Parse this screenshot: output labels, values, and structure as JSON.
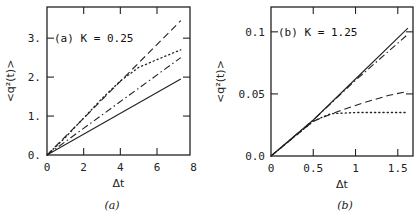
{
  "chart_data": [
    {
      "type": "line",
      "panel": "a",
      "annotation": "(a)  K = 0.25",
      "caption": "(a)",
      "xlabel": "Δt",
      "ylabel": "<q²(t)>",
      "xlim": [
        0,
        7.8
      ],
      "ylim": [
        0,
        3.8
      ],
      "xticks": [
        0,
        2,
        4,
        6,
        8
      ],
      "xtick_labels": [
        "0",
        "2",
        "4",
        "6",
        "8"
      ],
      "yticks": [
        0,
        1,
        2,
        3
      ],
      "ytick_labels": [
        "0.",
        "1.",
        "2.",
        "3."
      ],
      "grid": false,
      "series": [
        {
          "name": "solid",
          "style": "solid",
          "x": [
            0,
            7.3
          ],
          "y": [
            0,
            1.95
          ]
        },
        {
          "name": "dash-dot",
          "style": "dashdot",
          "x": [
            0,
            7.3
          ],
          "y": [
            0,
            2.5
          ]
        },
        {
          "name": "dotted",
          "style": "dotted",
          "x": [
            0,
            1,
            2,
            3,
            4,
            5,
            6,
            7.3
          ],
          "y": [
            0,
            0.45,
            0.95,
            1.45,
            1.9,
            2.25,
            2.45,
            2.7
          ]
        },
        {
          "name": "dashed",
          "style": "dashed",
          "x": [
            0,
            7.3
          ],
          "y": [
            0,
            3.45
          ]
        }
      ]
    },
    {
      "type": "line",
      "panel": "b",
      "annotation": "(b)  K = 1.25",
      "caption": "(b)",
      "xlabel": "Δt",
      "ylabel": "<q²(t)>",
      "xlim": [
        0,
        1.68
      ],
      "ylim": [
        0,
        0.12
      ],
      "xticks": [
        0,
        0.5,
        1,
        1.5
      ],
      "xtick_labels": [
        "0",
        "0.5",
        "1",
        "1.5"
      ],
      "yticks": [
        0,
        0.05,
        0.1
      ],
      "ytick_labels": [
        "0.0",
        "0.05",
        "0.1"
      ],
      "grid": false,
      "series": [
        {
          "name": "solid",
          "style": "solid",
          "x": [
            0,
            0.5,
            1.0,
            1.62
          ],
          "y": [
            0,
            0.029,
            0.062,
            0.103
          ]
        },
        {
          "name": "dash-dot",
          "style": "dashdot",
          "x": [
            0,
            0.5,
            1.0,
            1.62
          ],
          "y": [
            0,
            0.029,
            0.061,
            0.098
          ]
        },
        {
          "name": "dashed",
          "style": "dashed",
          "x": [
            0,
            0.5,
            0.8,
            1.1,
            1.4,
            1.62
          ],
          "y": [
            0,
            0.028,
            0.036,
            0.043,
            0.049,
            0.052
          ]
        },
        {
          "name": "dotted",
          "style": "dotted",
          "x": [
            0,
            0.5,
            0.7,
            1.0,
            1.62
          ],
          "y": [
            0,
            0.028,
            0.034,
            0.035,
            0.035
          ]
        }
      ]
    }
  ]
}
